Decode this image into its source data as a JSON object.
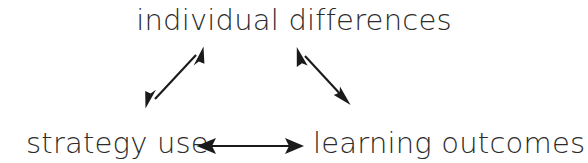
{
  "diagram": {
    "title": "",
    "background_color": "#ffffff",
    "text_color": "#2b2b2b",
    "line_color": "#1a1a1a",
    "nodes": [
      {
        "id": "individual-differences",
        "label": "individual differences",
        "position": "top-center"
      },
      {
        "id": "strategy-use",
        "label": "strategy use",
        "position": "bottom-left"
      },
      {
        "id": "learning-outcomes",
        "label": "learning outcomes",
        "position": "bottom-right"
      }
    ],
    "edges": [
      {
        "id": "edge-strategy-use-individual-differences",
        "from": "strategy-use",
        "to": "individual-differences",
        "style": "double-headed-arrow",
        "orientation": "diagonal-up-right"
      },
      {
        "id": "edge-individual-differences-learning-outcomes",
        "from": "individual-differences",
        "to": "learning-outcomes",
        "style": "double-headed-arrow",
        "orientation": "diagonal-down-right"
      },
      {
        "id": "edge-strategy-use-learning-outcomes",
        "from": "strategy-use",
        "to": "learning-outcomes",
        "style": "double-headed-arrow",
        "orientation": "horizontal"
      }
    ]
  }
}
